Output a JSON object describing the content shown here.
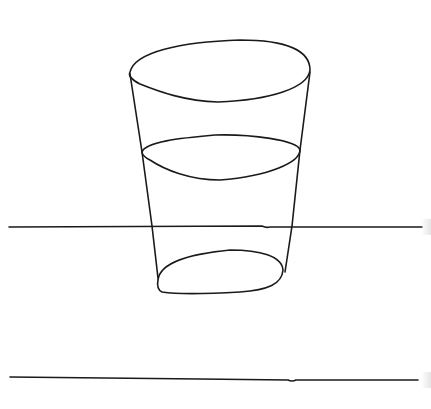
{
  "drawing": {
    "subject": "glass-of-water",
    "style": "hand-drawn line sketch",
    "ink_color": "#1a1a1a",
    "background_color": "#ffffff",
    "elements": [
      "glass-rim",
      "glass-left-side",
      "glass-right-side",
      "water-surface",
      "glass-base",
      "table-line-upper",
      "table-line-lower"
    ]
  }
}
